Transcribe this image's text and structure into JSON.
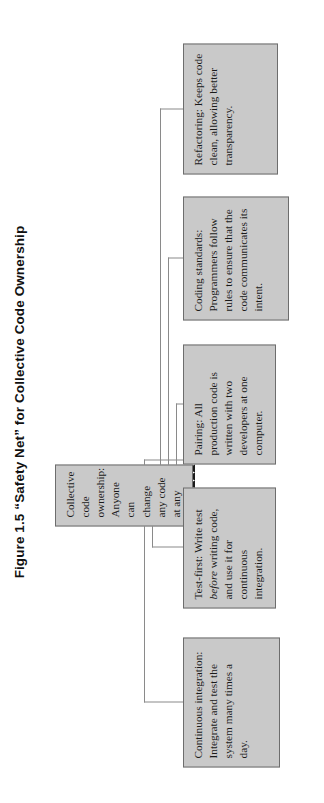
{
  "figure": {
    "title": "Figure 1.5 “Safety Net” for Collective Code Ownership",
    "type": "block-diagram",
    "orientation": "rotated-90-ccw",
    "node_fill": "#c9c9c9",
    "node_border": "#6d6d6d",
    "connector_color": "#8a8a8a",
    "arrow_color": "#1a1a1a",
    "background": "#ffffff"
  },
  "center_node": {
    "name": "collective-code-ownership",
    "text": "Collective code ownership: Anyone can change any code at any time"
  },
  "practice_nodes": [
    {
      "name": "continuous-integration",
      "title": "Continuous integration:",
      "text": "Continuous integration: Integrate and test the system many times a day."
    },
    {
      "name": "test-first",
      "title": "Test-first:",
      "text_before": "Test-first: Write test ",
      "emphasis": "before",
      "text_after": " writing code, and use it for continuous integration.",
      "text": "Test-first: Write test before writing code, and use it for continuous integration."
    },
    {
      "name": "pairing",
      "title": "Pairing:",
      "text": "Pairing: All production code is written with two developers at one computer."
    },
    {
      "name": "coding-standards",
      "title": "Coding standards:",
      "text": "Coding standards: Programmers follow rules to ensure that the code communicates its intent."
    },
    {
      "name": "refactoring",
      "title": "Refactoring:",
      "text": "Refactoring: Keeps code clean, allowing better transparency."
    }
  ],
  "connections": [
    {
      "from": "continuous-integration",
      "to": "collective-code-ownership"
    },
    {
      "from": "test-first",
      "to": "collective-code-ownership"
    },
    {
      "from": "pairing",
      "to": "collective-code-ownership"
    },
    {
      "from": "coding-standards",
      "to": "collective-code-ownership"
    },
    {
      "from": "refactoring",
      "to": "collective-code-ownership"
    }
  ]
}
